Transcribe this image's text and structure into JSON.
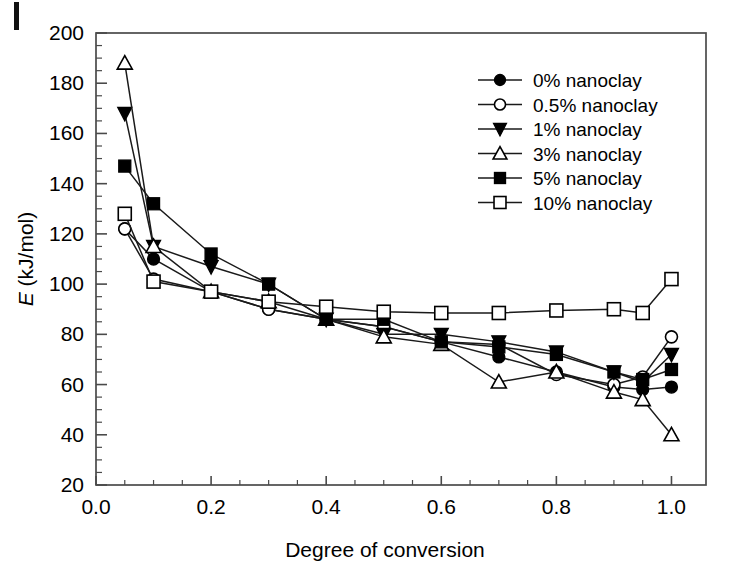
{
  "figure": {
    "scan_mark": "page-edge-artifact"
  },
  "chart_data": {
    "type": "line",
    "title": "",
    "xlabel": "Degree of conversion",
    "ylabel": "E (kJ/mol)",
    "ylabel_italic_prefix": "E",
    "ylabel_rest": " (kJ/mol)",
    "xlim": [
      0.0,
      1.06
    ],
    "ylim": [
      20,
      200
    ],
    "xticks": [
      0.0,
      0.2,
      0.4,
      0.6,
      0.8,
      1.0
    ],
    "xticklabels": [
      "0.0",
      "0.2",
      "0.4",
      "0.6",
      "0.8",
      "1.0"
    ],
    "yticks": [
      20,
      40,
      60,
      80,
      100,
      120,
      140,
      160,
      180,
      200
    ],
    "yticklabels": [
      "20",
      "40",
      "60",
      "80",
      "100",
      "120",
      "140",
      "160",
      "180",
      "200"
    ],
    "x_minor_interval": 0.05,
    "y_minor_interval": 5,
    "grid": false,
    "legend_position": "upper right",
    "x": [
      0.05,
      0.1,
      0.2,
      0.3,
      0.4,
      0.5,
      0.6,
      0.7,
      0.8,
      0.9,
      0.95,
      1.0
    ],
    "series": [
      {
        "name": "0% nanoclay",
        "marker": "filled-circle",
        "values": [
          122,
          110,
          97,
          90,
          86,
          83,
          77,
          71,
          65,
          59,
          58,
          59
        ]
      },
      {
        "name": "0.5% nanoclay",
        "marker": "open-circle",
        "values": [
          122,
          102,
          97,
          90,
          86,
          83,
          77,
          76,
          64,
          60,
          63,
          79
        ]
      },
      {
        "name": "1% nanoclay",
        "marker": "filled-down-triangle",
        "values": [
          168,
          115,
          107,
          100,
          86,
          80,
          80,
          77,
          73,
          65,
          61,
          72
        ]
      },
      {
        "name": "3% nanoclay",
        "marker": "open-up-triangle",
        "values": [
          188,
          115,
          97,
          93,
          86,
          79,
          76,
          61,
          65,
          57,
          54,
          40
        ]
      },
      {
        "name": "5% nanoclay",
        "marker": "filled-square",
        "values": [
          147,
          132,
          112,
          100,
          86,
          86,
          77,
          75,
          72,
          65,
          62,
          66
        ]
      },
      {
        "name": "10% nanoclay",
        "marker": "open-square",
        "values": [
          128,
          101,
          97,
          93,
          91,
          89,
          88.5,
          88.5,
          89.5,
          90,
          88.5,
          102
        ]
      }
    ]
  }
}
